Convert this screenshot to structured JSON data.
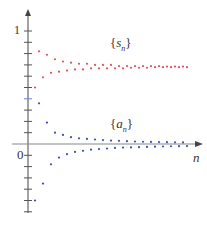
{
  "chart_data": {
    "type": "scatter",
    "title": "",
    "xlabel": "n",
    "ylabel": "",
    "y_tick_labels": [
      "0",
      "1"
    ],
    "ylim": [
      -0.6,
      1.05
    ],
    "y_tick_step": 0.1,
    "grid": false,
    "legend": "inline annotations",
    "series": [
      {
        "name": "{s_n}",
        "label_text": "{sn}",
        "color": "#e0525a",
        "n": [
          1,
          2,
          3,
          4,
          5,
          6,
          7,
          8,
          9,
          10,
          11,
          12,
          13,
          14,
          15,
          16,
          17,
          18,
          19,
          20,
          21,
          22,
          23,
          24,
          25,
          26,
          27,
          28,
          29,
          30,
          31,
          32,
          33,
          34,
          35,
          36,
          37,
          38,
          39
        ],
        "values": [
          0.5,
          0.82,
          0.59,
          0.79,
          0.63,
          0.75,
          0.64,
          0.73,
          0.65,
          0.72,
          0.66,
          0.71,
          0.66,
          0.71,
          0.67,
          0.7,
          0.67,
          0.7,
          0.67,
          0.7,
          0.67,
          0.69,
          0.67,
          0.69,
          0.675,
          0.69,
          0.675,
          0.69,
          0.675,
          0.69,
          0.68,
          0.69,
          0.68,
          0.685,
          0.68,
          0.685,
          0.68,
          0.685,
          0.68
        ]
      },
      {
        "name": "{a_n}",
        "label_text": "{an}",
        "color": "#3b4fbf",
        "n": [
          1,
          2,
          3,
          4,
          5,
          6,
          7,
          8,
          9,
          10,
          11,
          12,
          13,
          14,
          15,
          16,
          17,
          18,
          19,
          20,
          21,
          22,
          23,
          24,
          25,
          26,
          27,
          28,
          29,
          30,
          31,
          32,
          33,
          34,
          35,
          36,
          37,
          38,
          39
        ],
        "values": [
          -0.5,
          0.36,
          -0.35,
          0.19,
          -0.18,
          0.1,
          -0.12,
          0.08,
          -0.09,
          0.06,
          -0.07,
          0.05,
          -0.06,
          0.045,
          -0.05,
          0.04,
          -0.045,
          0.035,
          -0.04,
          0.03,
          -0.035,
          0.028,
          -0.032,
          0.025,
          -0.03,
          0.022,
          -0.028,
          0.02,
          -0.026,
          0.018,
          -0.024,
          0.017,
          -0.022,
          0.016,
          -0.02,
          0.015,
          -0.019,
          0.014,
          -0.018
        ]
      }
    ]
  },
  "labels": {
    "one": "1",
    "zero": "0",
    "n_axis": "n",
    "s_open": "{",
    "s_var": "s",
    "s_sub": "n",
    "s_close": "}",
    "a_open": "{",
    "a_var": "a",
    "a_sub": "n",
    "a_close": "}"
  },
  "colors": {
    "axis": "#666666",
    "red": "#e0525a",
    "blue": "#3b4fbf",
    "highlight_tick": "#6b7fd6"
  }
}
